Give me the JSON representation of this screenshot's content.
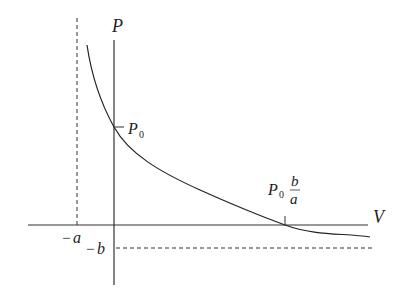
{
  "diagram": {
    "type": "graph-sketch",
    "axes": {
      "x_label": "V",
      "y_label": "P"
    },
    "labels": {
      "p0_main": "P",
      "p0_sub": "0",
      "neg_a_minus": "−",
      "neg_a_var": "a",
      "neg_b_minus": "−",
      "neg_b_var": "b",
      "intercept_p": "P",
      "intercept_sub": "0",
      "intercept_num": "b",
      "intercept_den": "a"
    },
    "annotations": [
      {
        "id": "y-intercept",
        "text": "P0",
        "meaning": "P-axis intercept"
      },
      {
        "id": "x-intercept",
        "text": "P0 b/a",
        "meaning": "V-axis intercept"
      },
      {
        "id": "vertical-asymptote",
        "text": "-a",
        "style": "dashed"
      },
      {
        "id": "horizontal-asymptote",
        "text": "-b",
        "style": "dashed"
      }
    ],
    "colors": {
      "stroke": "#222222",
      "background": "#ffffff"
    }
  }
}
